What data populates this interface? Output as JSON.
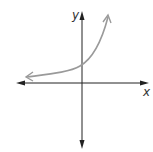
{
  "graph": {
    "x_axis_label": "x",
    "y_axis_label": "y",
    "curve_type": "exponential growth",
    "curve_color": "#9a9a9a",
    "axis_color": "#222222"
  }
}
